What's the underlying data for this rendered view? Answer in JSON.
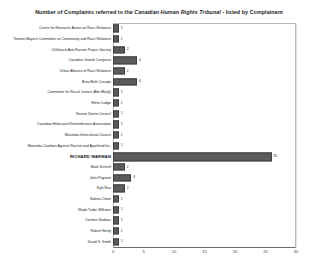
{
  "chart_data": {
    "type": "bar",
    "orientation": "horizontal",
    "title_prefix": "Number of Complaints referred to the ",
    "title_emphasis": "Canadian Human Rights Tribunal",
    "title_suffix": " - listed by Complainant",
    "title": "Number of Complaints referred to the Canadian Human Rights Tribunal - listed by Complainant",
    "xlabel": "",
    "ylabel": "",
    "xlim": [
      0,
      30
    ],
    "xticks": [
      0,
      5,
      10,
      15,
      20,
      25,
      30
    ],
    "grid": true,
    "legend": "none",
    "bar_color": "#5b5b5b",
    "highlight_category": "RICHARD WARMAN",
    "categories": [
      "Centre for Research-Action on Race Relations",
      "Toronto Mayor's Committee on Community and Race Relations",
      "Chilliwack Anti-Racism Project Society",
      "Canadian Jewish Congress",
      "Urban Alliance of Race Relations",
      "B'nai Brith Canada",
      "Committee for Racial Justice (Abir Bhalji)",
      "Helen Lodge",
      "Toronto Zionist Council",
      "Canadian Holocaust Remembrance Association",
      "Manitoba Intercultural Council",
      "Manitoba Coalition Against Racism and Apartheid Inc.",
      "RICHARD WARMAN",
      "Mark Schnell",
      "John Payzant",
      "Kyle Rau",
      "Sabina Citron",
      "Wade Tudor Williams",
      "Carmen Nadeau",
      "Robert Neely",
      "David S. Smith"
    ],
    "values": [
      1,
      1,
      2,
      4,
      2,
      4,
      1,
      1,
      1,
      1,
      1,
      1,
      26,
      2,
      3,
      2,
      1,
      1,
      1,
      1,
      1
    ]
  }
}
